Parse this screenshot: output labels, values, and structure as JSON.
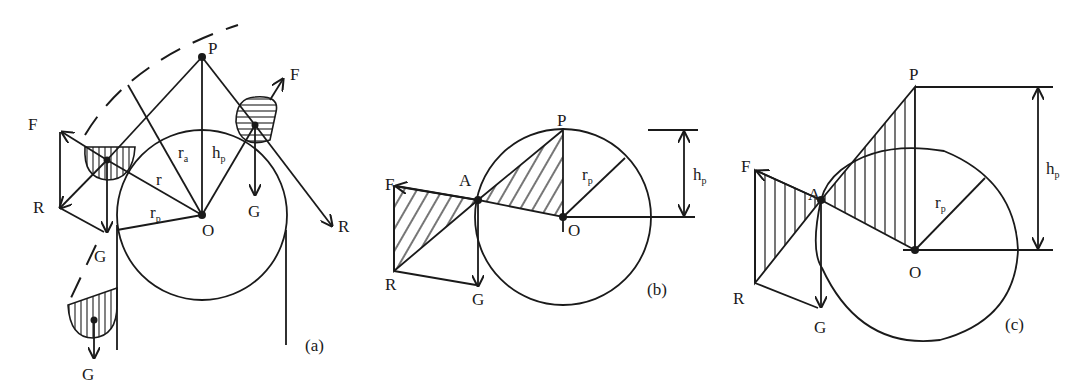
{
  "figure": {
    "panels": [
      {
        "id": "a",
        "caption": "(a)",
        "labels": {
          "P": "P",
          "O": "O",
          "F_left": "F",
          "F_right": "F",
          "R_left": "R",
          "R_right": "R",
          "G_left": "G",
          "G_right": "G",
          "G_bottom": "G",
          "r": "r",
          "r_a": "r",
          "r_a_sub": "a",
          "h_p": "h",
          "h_p_sub": "p",
          "r_p": "r",
          "r_p_sub": "p"
        }
      },
      {
        "id": "b",
        "caption": "(b)",
        "labels": {
          "P": "P",
          "O": "O",
          "A": "A",
          "F": "F",
          "R": "R",
          "G": "G",
          "r_p": "r",
          "r_p_sub": "p",
          "h_p": "h",
          "h_p_sub": "p"
        }
      },
      {
        "id": "c",
        "caption": "(c)",
        "labels": {
          "P": "P",
          "O": "O",
          "A": "A",
          "F": "F",
          "R": "R",
          "G": "G",
          "r_p": "r",
          "r_p_sub": "p",
          "h_p": "h",
          "h_p_sub": "p"
        }
      }
    ]
  }
}
